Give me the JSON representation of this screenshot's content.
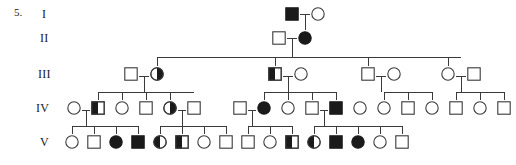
{
  "item_number": "5.",
  "diagram": {
    "type": "pedigree-chart",
    "symbol_legend": {
      "square": "male",
      "circle": "female",
      "open": "unaffected",
      "filled": "affected",
      "half-filled": "carrier"
    },
    "generation_labels": [
      "I",
      "II",
      "III",
      "IV",
      "V"
    ],
    "generations": [
      {
        "label": "I",
        "y": 14,
        "individuals": [
          {
            "id": "I-1",
            "shape": "square",
            "fill": "filled",
            "x": 292
          },
          {
            "id": "I-2",
            "shape": "circle",
            "fill": "open",
            "x": 318
          }
        ]
      },
      {
        "label": "II",
        "y": 38,
        "individuals": [
          {
            "id": "II-1",
            "shape": "square",
            "fill": "open",
            "x": 279
          },
          {
            "id": "II-2",
            "shape": "circle",
            "fill": "filled",
            "x": 305
          }
        ]
      },
      {
        "label": "III",
        "y": 74,
        "individuals": [
          {
            "id": "III-1",
            "shape": "square",
            "fill": "open",
            "x": 131
          },
          {
            "id": "III-2",
            "shape": "circle",
            "fill": "half-right",
            "x": 157
          },
          {
            "id": "III-3",
            "shape": "square",
            "fill": "half-left",
            "x": 275
          },
          {
            "id": "III-4",
            "shape": "circle",
            "fill": "open",
            "x": 301
          },
          {
            "id": "III-5",
            "shape": "square",
            "fill": "open",
            "x": 368
          },
          {
            "id": "III-6",
            "shape": "circle",
            "fill": "open",
            "x": 394
          },
          {
            "id": "III-7",
            "shape": "circle",
            "fill": "open",
            "x": 448
          },
          {
            "id": "III-8",
            "shape": "square",
            "fill": "open",
            "x": 474
          }
        ]
      },
      {
        "label": "IV",
        "y": 108,
        "individuals": [
          {
            "id": "IV-1",
            "shape": "circle",
            "fill": "open",
            "x": 74
          },
          {
            "id": "IV-2",
            "shape": "square",
            "fill": "half-left",
            "x": 98
          },
          {
            "id": "IV-3",
            "shape": "circle",
            "fill": "open",
            "x": 122
          },
          {
            "id": "IV-4",
            "shape": "square",
            "fill": "open",
            "x": 146
          },
          {
            "id": "IV-5",
            "shape": "circle",
            "fill": "half-right",
            "x": 170
          },
          {
            "id": "IV-6",
            "shape": "square",
            "fill": "open",
            "x": 194
          },
          {
            "id": "IV-7",
            "shape": "square",
            "fill": "open",
            "x": 240
          },
          {
            "id": "IV-8",
            "shape": "circle",
            "fill": "filled",
            "x": 264
          },
          {
            "id": "IV-9",
            "shape": "circle",
            "fill": "open",
            "x": 288
          },
          {
            "id": "IV-10",
            "shape": "square",
            "fill": "open",
            "x": 312
          },
          {
            "id": "IV-11",
            "shape": "square",
            "fill": "filled",
            "x": 336
          },
          {
            "id": "IV-12",
            "shape": "circle",
            "fill": "open",
            "x": 360
          },
          {
            "id": "IV-13",
            "shape": "circle",
            "fill": "open",
            "x": 384
          },
          {
            "id": "IV-14",
            "shape": "square",
            "fill": "open",
            "x": 408
          },
          {
            "id": "IV-15",
            "shape": "circle",
            "fill": "open",
            "x": 432
          },
          {
            "id": "IV-16",
            "shape": "square",
            "fill": "open",
            "x": 456
          },
          {
            "id": "IV-17",
            "shape": "circle",
            "fill": "open",
            "x": 480
          },
          {
            "id": "IV-18",
            "shape": "square",
            "fill": "open",
            "x": 504
          }
        ]
      },
      {
        "label": "V",
        "y": 142,
        "individuals": [
          {
            "id": "V-1",
            "shape": "circle",
            "fill": "open",
            "x": 72
          },
          {
            "id": "V-2",
            "shape": "square",
            "fill": "open",
            "x": 94
          },
          {
            "id": "V-3",
            "shape": "circle",
            "fill": "filled",
            "x": 116
          },
          {
            "id": "V-4",
            "shape": "square",
            "fill": "filled",
            "x": 138
          },
          {
            "id": "V-5",
            "shape": "circle",
            "fill": "half-left",
            "x": 160
          },
          {
            "id": "V-6",
            "shape": "square",
            "fill": "half-left",
            "x": 182
          },
          {
            "id": "V-7",
            "shape": "circle",
            "fill": "open",
            "x": 204
          },
          {
            "id": "V-8",
            "shape": "square",
            "fill": "open",
            "x": 226
          },
          {
            "id": "V-9",
            "shape": "square",
            "fill": "open",
            "x": 248
          },
          {
            "id": "V-10",
            "shape": "circle",
            "fill": "open",
            "x": 270
          },
          {
            "id": "V-11",
            "shape": "square",
            "fill": "half-left",
            "x": 292
          },
          {
            "id": "V-12",
            "shape": "circle",
            "fill": "half-left",
            "x": 314
          },
          {
            "id": "V-13",
            "shape": "square",
            "fill": "filled",
            "x": 336
          },
          {
            "id": "V-14",
            "shape": "circle",
            "fill": "filled",
            "x": 358
          },
          {
            "id": "V-15",
            "shape": "circle",
            "fill": "open",
            "x": 380
          },
          {
            "id": "V-16",
            "shape": "square",
            "fill": "open",
            "x": 402
          }
        ]
      }
    ],
    "counts": {
      "total_individuals": 50,
      "affected": 8,
      "carriers": 8
    }
  }
}
